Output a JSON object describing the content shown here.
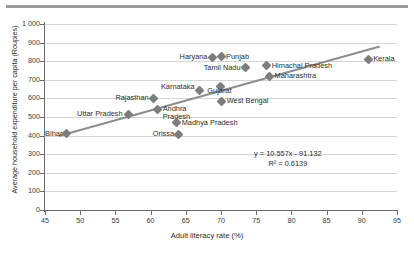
{
  "chart_data": {
    "type": "scatter",
    "title": "",
    "xlabel": "Adult literacy rate (%)",
    "ylabel": "Average household expenditure per capita (Roupies)",
    "xlim": [
      45,
      95
    ],
    "ylim": [
      0,
      1000
    ],
    "xticks": [
      "45",
      "50",
      "55",
      "60",
      "65",
      "70",
      "75",
      "80",
      "85",
      "90",
      "95"
    ],
    "yticks": [
      "0",
      "100",
      "200",
      "300",
      "400",
      "500",
      "600",
      "700",
      "800",
      "900",
      "1 000"
    ],
    "grid": "horizontal",
    "legend": "none",
    "series_name": "Indian states",
    "points": [
      {
        "label": "Bihar",
        "x": 48.0,
        "y": 410,
        "lx": -3,
        "ly": -4,
        "align": "right"
      },
      {
        "label": "Uttar Pradesh",
        "x": 56.8,
        "y": 515,
        "lx": -4,
        "ly": -4,
        "align": "right"
      },
      {
        "label": "Rajasthan",
        "x": 60.4,
        "y": 600,
        "lx": -4,
        "ly": -4,
        "align": "right"
      },
      {
        "label": "Andhra Pradesh",
        "x": 61.0,
        "y": 540,
        "lx": 5,
        "ly": -5,
        "align": "left-wrap"
      },
      {
        "label": "Madhya Pradesh",
        "x": 63.7,
        "y": 470,
        "lx": 5,
        "ly": -4,
        "align": "left"
      },
      {
        "label": "Orissa",
        "x": 64.0,
        "y": 408,
        "lx": -4,
        "ly": -4,
        "align": "right"
      },
      {
        "label": "Karnataka",
        "x": 67.0,
        "y": 645,
        "lx": -4,
        "ly": -7,
        "align": "right"
      },
      {
        "label": "Haryana",
        "x": 68.8,
        "y": 820,
        "lx": -4,
        "ly": -4,
        "align": "right"
      },
      {
        "label": "Punjab",
        "x": 70.0,
        "y": 825,
        "lx": 5,
        "ly": -4,
        "align": "left"
      },
      {
        "label": "Gujarat",
        "x": 69.9,
        "y": 665,
        "lx": -1,
        "ly": 1,
        "align": "center-below"
      },
      {
        "label": "Tamil Nadu",
        "x": 73.5,
        "y": 765,
        "lx": -4,
        "ly": -4,
        "align": "right"
      },
      {
        "label": "West Bengal",
        "x": 70.1,
        "y": 585,
        "lx": 5,
        "ly": -4,
        "align": "left"
      },
      {
        "label": "Himachal Pradesh",
        "x": 76.5,
        "y": 775,
        "lx": 5,
        "ly": -4,
        "align": "left"
      },
      {
        "label": "Maharashtra",
        "x": 76.9,
        "y": 720,
        "lx": 5,
        "ly": -4,
        "align": "left"
      },
      {
        "label": "Kerala",
        "x": 90.9,
        "y": 810,
        "lx": 5,
        "ly": -4,
        "align": "left"
      }
    ],
    "trendline": {
      "slope": 10.557,
      "intercept": -91.132,
      "r_squared": 0.6139,
      "equation": "y = 10.557x - 91.132",
      "r2_text": "R² = 0.6139",
      "x_start": 47.0,
      "x_end": 92.5
    },
    "annotation_position": {
      "x": 79.5,
      "y": 295
    }
  }
}
